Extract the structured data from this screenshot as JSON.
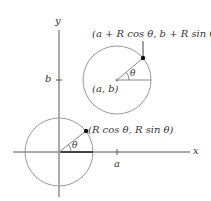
{
  "diagram": {
    "axes": {
      "x_label": "x",
      "y_label": "y",
      "x_tick_label": "a",
      "y_tick_label": "b"
    },
    "origin_circle": {
      "point_label": "(R cos θ, R sin θ)",
      "angle_label": "θ"
    },
    "shifted_circle": {
      "center_label": "(a, b)",
      "point_label": "(a + R cos θ, b + R sin θ)",
      "angle_label": "θ"
    },
    "colors": {
      "axis": "#555555",
      "circle": "#999999",
      "point": "#111111",
      "text": "#333333"
    }
  }
}
